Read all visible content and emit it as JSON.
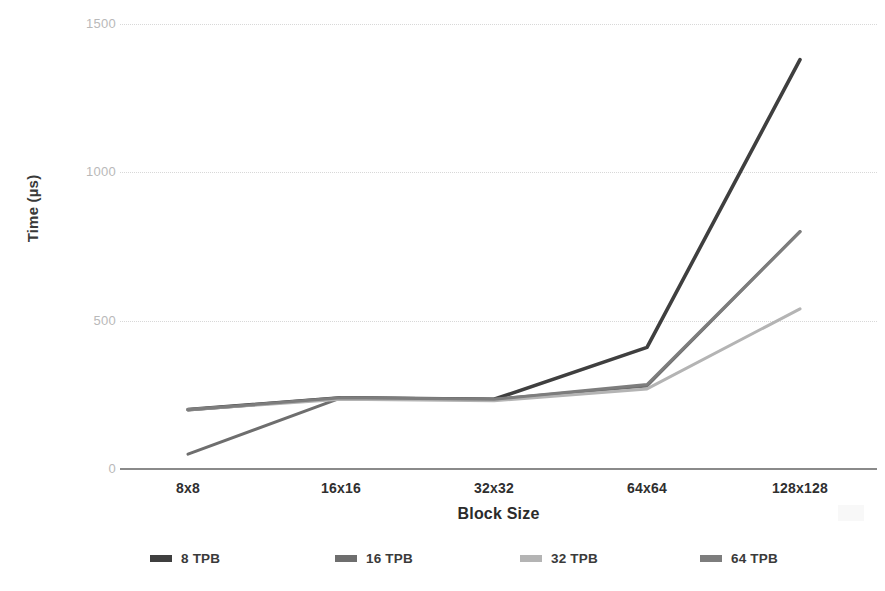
{
  "chart_data": {
    "type": "line",
    "title": "",
    "xlabel": "Block Size",
    "ylabel": "Time (µs)",
    "categories": [
      "8x8",
      "16x16",
      "32x32",
      "64x64",
      "128x128"
    ],
    "ylim": [
      0,
      1500
    ],
    "yticks": [
      0,
      500,
      1000,
      1500
    ],
    "ytick_labels": [
      "0",
      "500",
      "1000",
      "1500"
    ],
    "grid": "horizontal-dotted",
    "legend_position": "bottom",
    "series": [
      {
        "name": "8 TPB",
        "color": "#3f3f3f",
        "values": [
          200,
          240,
          235,
          410,
          1380
        ]
      },
      {
        "name": "16 TPB",
        "color": "#6e6e6e",
        "values": [
          50,
          240,
          235,
          280,
          800
        ]
      },
      {
        "name": "32 TPB",
        "color": "#b4b4b4",
        "values": [
          200,
          235,
          230,
          270,
          540
        ]
      },
      {
        "name": "64 TPB",
        "color": "#7d7d7d",
        "values": [
          200,
          240,
          235,
          285,
          800
        ]
      }
    ]
  },
  "axes": {
    "y_title": "Time (µs)",
    "x_title": "Block Size",
    "y_tick_labels": [
      "1500",
      "1000",
      "500",
      "0"
    ],
    "x_tick_labels": [
      "8x8",
      "16x16",
      "32x32",
      "64x64",
      "128x128"
    ]
  },
  "legend": {
    "items": [
      {
        "label": "8 TPB",
        "color": "#3f3f3f"
      },
      {
        "label": "16 TPB",
        "color": "#6e6e6e"
      },
      {
        "label": "32 TPB",
        "color": "#b4b4b4"
      },
      {
        "label": "64 TPB",
        "color": "#7d7d7d"
      }
    ]
  },
  "colors": {
    "gridline": "#d8d8d8",
    "axis": "#8a8a8a",
    "tick_text": "#b9b9b9",
    "label_text": "#2f2f2f",
    "background": "#ffffff"
  }
}
